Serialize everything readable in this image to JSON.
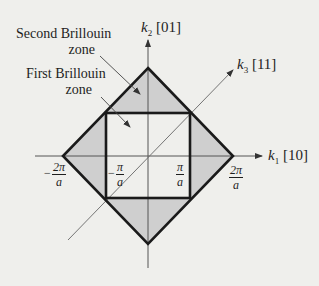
{
  "figure": {
    "colors": {
      "background": "#efefec",
      "second_zone_fill": "#cfcfcf",
      "first_zone_fill": "#efefec",
      "zone_boundary": "#1a1a1a",
      "axis": "#555555",
      "text": "#1e1e1e"
    },
    "labels": {
      "second_zone_line1": "Second Brillouin",
      "second_zone_line2": "zone",
      "first_zone_line1": "First Brillouin",
      "first_zone_line2": "zone"
    },
    "axes": {
      "k2": {
        "symbol": "k",
        "subscript": "2",
        "direction": "[01]"
      },
      "k3": {
        "symbol": "k",
        "subscript": "3",
        "direction": "[11]"
      },
      "k1": {
        "symbol": "k",
        "subscript": "1",
        "direction": "[10]"
      }
    },
    "ticks": {
      "neg_2pi_a": {
        "sign": "−",
        "num": "2π",
        "den": "a"
      },
      "neg_pi_a": {
        "sign": "−",
        "num": "π",
        "den": "a"
      },
      "pi_a": {
        "sign": "",
        "num": "π",
        "den": "a"
      },
      "pos_2pi_a": {
        "sign": "",
        "num": "2π",
        "den": "a"
      }
    }
  }
}
